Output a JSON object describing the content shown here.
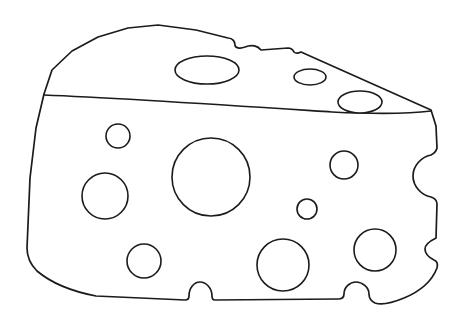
{
  "document": {
    "title": "Cheese Wedge Line Art",
    "subject": "swiss-cheese-wedge",
    "style": "coloring-book outline drawing",
    "canvas": {
      "width": 464,
      "height": 328
    },
    "colors": {
      "background": "#ffffff",
      "stroke": "#1b1b1b",
      "fill": "#ffffff"
    },
    "stroke_width_px": 1.7
  },
  "artwork": {
    "name": "cheese-wedge",
    "description": "Outline of a wedge of swiss cheese seen in three-quarter view, with a flat angled top face, a tall curved front face, and round holes scattered across both faces. The top and right silhouette edges are interrupted by half-round bites where holes meet the rind.",
    "outline_path": "M 44 94 L 52 70 L 72 51 L 98 37 L 128 28 L 158 25 L 196 30 L 228 38 C 233 38 235 42 235 45 C 235 48 240 49 245 47 C 252 44 258 46 261 50 L 288 48 C 291 48 293 50 294 52 C 296 54 299 53 301 52 L 431 110 L 436 126 L 437 148 C 436 152 433 154 431 155 C 421 157 413 166 413 176 C 413 186 421 195 431 197 C 434 198 437 200 437 204 L 436 238 C 432 240 425 243 425 249 C 425 255 430 258 434 260 C 437 261 438 264 437 268 C 432 281 421 291 404 298 C 392 303 381 305 375 303 C 371 301 369 297 369 294 C 369 287 362 282 356 282 C 350 282 344 287 344 294 C 344 297 342 299 338 299 L 215 300 C 213 300 212 299 212 296 C 212 288 206 282 200 282 C 194 282 189 288 189 296 C 189 298 188 300 185 300 L 96 296 C 70 291 50 282 37 271 C 30 264 27 256 27 248 L 30 178 L 36 128 Z",
    "rim_line_path": "M 44 95 C 120 98 240 106 332 112 C 372 114 408 114 431 111",
    "holes": [
      {
        "name": "top-face-hole-large",
        "face": "top",
        "shape": "ellipse",
        "cx": 207,
        "cy": 70,
        "rx": 32,
        "ry": 14
      },
      {
        "name": "top-face-hole-small",
        "face": "top",
        "shape": "ellipse",
        "cx": 310,
        "cy": 77,
        "rx": 16,
        "ry": 8
      },
      {
        "name": "top-face-hole-right",
        "face": "top",
        "shape": "ellipse",
        "cx": 360,
        "cy": 102,
        "rx": 22,
        "ry": 11
      },
      {
        "name": "front-face-hole-upper-left",
        "face": "front",
        "shape": "circle",
        "cx": 118,
        "cy": 136,
        "r": 12
      },
      {
        "name": "front-face-hole-center-large",
        "face": "front",
        "shape": "circle",
        "cx": 211,
        "cy": 177,
        "r": 39
      },
      {
        "name": "front-face-hole-mid-left",
        "face": "front",
        "shape": "circle",
        "cx": 105,
        "cy": 196,
        "r": 23
      },
      {
        "name": "front-face-hole-mid-right",
        "face": "front",
        "shape": "circle",
        "cx": 344,
        "cy": 165,
        "r": 14
      },
      {
        "name": "front-face-hole-tiny",
        "face": "front",
        "shape": "circle",
        "cx": 307,
        "cy": 209,
        "r": 10
      },
      {
        "name": "front-face-hole-lower-left",
        "face": "front",
        "shape": "circle",
        "cx": 144,
        "cy": 261,
        "r": 17
      },
      {
        "name": "front-face-hole-lower-mid",
        "face": "front",
        "shape": "circle",
        "cx": 283,
        "cy": 265,
        "r": 26
      },
      {
        "name": "front-face-hole-lower-right",
        "face": "front",
        "shape": "circle",
        "cx": 375,
        "cy": 250,
        "r": 21
      }
    ],
    "edge_bites": [
      {
        "name": "top-edge-bite-left",
        "edge": "top",
        "cx": 240,
        "cy": 44,
        "r": 6
      },
      {
        "name": "top-edge-bite-right",
        "edge": "top",
        "cx": 294,
        "cy": 50,
        "r": 4
      },
      {
        "name": "right-edge-bite-large",
        "edge": "right",
        "cx": 433,
        "cy": 176,
        "r": 21
      },
      {
        "name": "right-edge-bite-small",
        "edge": "right",
        "cx": 431,
        "cy": 254,
        "r": 8
      },
      {
        "name": "bottom-edge-bite-left",
        "edge": "bottom",
        "cx": 200,
        "cy": 294,
        "r": 11
      },
      {
        "name": "bottom-edge-bite-right",
        "edge": "bottom",
        "cx": 356,
        "cy": 292,
        "r": 13
      }
    ],
    "hole_count": 11,
    "edge_bite_count": 6
  }
}
